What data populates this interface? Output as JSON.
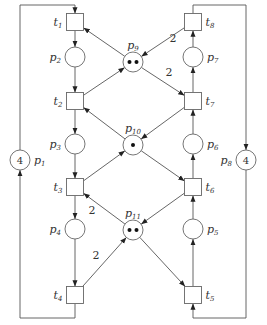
{
  "places": [
    {
      "id": "p1",
      "name": "p",
      "sub": "1",
      "tokens": 4,
      "token_label": "4"
    },
    {
      "id": "p2",
      "name": "p",
      "sub": "2",
      "tokens": 0
    },
    {
      "id": "p3",
      "name": "p",
      "sub": "3",
      "tokens": 0
    },
    {
      "id": "p4",
      "name": "p",
      "sub": "4",
      "tokens": 0
    },
    {
      "id": "p5",
      "name": "p",
      "sub": "5",
      "tokens": 0
    },
    {
      "id": "p6",
      "name": "p",
      "sub": "6",
      "tokens": 0
    },
    {
      "id": "p7",
      "name": "p",
      "sub": "7",
      "tokens": 0
    },
    {
      "id": "p8",
      "name": "p",
      "sub": "8",
      "tokens": 4,
      "token_label": "4"
    },
    {
      "id": "p9",
      "name": "p",
      "sub": "9",
      "tokens": 2
    },
    {
      "id": "p10",
      "name": "p",
      "sub": "10",
      "tokens": 1
    },
    {
      "id": "p11",
      "name": "p",
      "sub": "11",
      "tokens": 2
    }
  ],
  "transitions": [
    {
      "id": "t1",
      "name": "t",
      "sub": "1"
    },
    {
      "id": "t2",
      "name": "t",
      "sub": "2"
    },
    {
      "id": "t3",
      "name": "t",
      "sub": "3"
    },
    {
      "id": "t4",
      "name": "t",
      "sub": "4"
    },
    {
      "id": "t5",
      "name": "t",
      "sub": "5"
    },
    {
      "id": "t6",
      "name": "t",
      "sub": "6"
    },
    {
      "id": "t7",
      "name": "t",
      "sub": "7"
    },
    {
      "id": "t8",
      "name": "t",
      "sub": "8"
    }
  ],
  "arcs": [
    {
      "from": "p1",
      "to": "t1"
    },
    {
      "from": "t4",
      "to": "p1"
    },
    {
      "from": "t1",
      "to": "p2"
    },
    {
      "from": "p2",
      "to": "t2"
    },
    {
      "from": "t2",
      "to": "p3"
    },
    {
      "from": "p3",
      "to": "t3"
    },
    {
      "from": "t3",
      "to": "p4"
    },
    {
      "from": "p4",
      "to": "t4"
    },
    {
      "from": "p9",
      "to": "t1"
    },
    {
      "from": "t2",
      "to": "p9"
    },
    {
      "from": "p10",
      "to": "t2"
    },
    {
      "from": "t3",
      "to": "p10"
    },
    {
      "from": "p11",
      "to": "t3",
      "weight": "2"
    },
    {
      "from": "t4",
      "to": "p11",
      "weight": "2"
    },
    {
      "from": "p8",
      "to": "t5"
    },
    {
      "from": "t8",
      "to": "p8"
    },
    {
      "from": "t5",
      "to": "p5"
    },
    {
      "from": "p5",
      "to": "t6"
    },
    {
      "from": "t6",
      "to": "p6"
    },
    {
      "from": "p6",
      "to": "t7"
    },
    {
      "from": "t7",
      "to": "p7"
    },
    {
      "from": "p7",
      "to": "t8"
    },
    {
      "from": "t8",
      "to": "p9",
      "weight": "2"
    },
    {
      "from": "p9",
      "to": "t7",
      "weight": "2"
    },
    {
      "from": "t7",
      "to": "p10"
    },
    {
      "from": "p10",
      "to": "t6"
    },
    {
      "from": "t6",
      "to": "p11"
    },
    {
      "from": "p11",
      "to": "t5"
    }
  ]
}
